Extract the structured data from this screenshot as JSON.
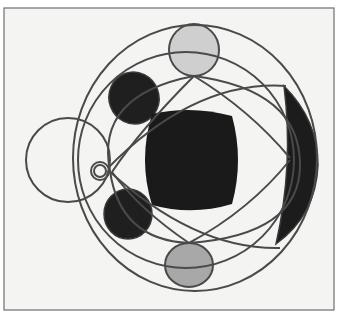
{
  "image": {
    "subject": "wire-frame stained glass geometric ornament",
    "background": "#f4f4f2",
    "border_color": "#6e6e6e",
    "wire_color": "#4a4a4a",
    "dark_fill": "#1c1c1c",
    "light_fill": "#cfcfcf",
    "gray_fill": "#a8a8a8"
  },
  "shapes": {
    "outer_ellipse": {
      "cx": 195,
      "cy": 157,
      "rx": 120,
      "ry": 133
    },
    "large_circle": {
      "cx": 185,
      "cy": 160,
      "r": 110
    },
    "left_circle": {
      "cx": 68,
      "cy": 160,
      "r": 43
    },
    "small_ring": {
      "cx": 100,
      "cy": 171,
      "r": 9
    },
    "top_pane": {
      "cx": 194,
      "cy": 50,
      "rx": 25,
      "ry": 26
    },
    "bottom_pane": {
      "cx": 189,
      "cy": 265,
      "rx": 24,
      "ry": 22
    },
    "upper_left_pane": {
      "cx": 134,
      "cy": 98,
      "rx": 24,
      "ry": 26
    },
    "lower_left_pane": {
      "cx": 128,
      "cy": 214,
      "rx": 24,
      "ry": 25
    },
    "center_pane": {
      "x": 143,
      "y": 113,
      "w": 96,
      "h": 97
    }
  }
}
